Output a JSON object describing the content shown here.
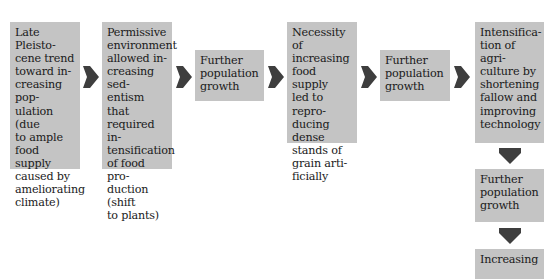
{
  "diagram": {
    "type": "flowchart",
    "colors": {
      "box_fill": "#c4c4c4",
      "arrow_fill": "#3e3e3e",
      "text": "#1a1a1a",
      "background": "#ffffff"
    },
    "nodes": [
      {
        "id": "n1",
        "text": "Late Pleisto-\ncene trend\ntoward in-\ncreasing pop-\nulation (due\nto ample\nfood supply\ncaused by\nameliorating\nclimate)"
      },
      {
        "id": "n2",
        "text": "Permissive\nenvironment\nallowed in-\ncreasing sed-\nentism that\nrequired in-\ntensification\nof food pro-\nduction (shift\nto plants)"
      },
      {
        "id": "n3",
        "text": "Further\npopulation\ngrowth"
      },
      {
        "id": "n4",
        "text": "Necessity of\nincreasing\nfood supply\nled to repro-\nducing dense\nstands of\ngrain arti-\nficially"
      },
      {
        "id": "n5",
        "text": "Further\npopulation\ngrowth"
      },
      {
        "id": "n6",
        "text": "Intensifica-\ntion of agri-\nculture by\nshortening\nfallow and\nimproving\ntechnology"
      },
      {
        "id": "n7",
        "text": "Further\npopulation\ngrowth"
      },
      {
        "id": "n8",
        "text": "Increasing"
      }
    ],
    "edges": [
      {
        "from": "n1",
        "to": "n2",
        "direction": "right"
      },
      {
        "from": "n2",
        "to": "n3",
        "direction": "right"
      },
      {
        "from": "n3",
        "to": "n4",
        "direction": "right"
      },
      {
        "from": "n4",
        "to": "n5",
        "direction": "right"
      },
      {
        "from": "n5",
        "to": "n6",
        "direction": "right"
      },
      {
        "from": "n6",
        "to": "n7",
        "direction": "down"
      },
      {
        "from": "n7",
        "to": "n8",
        "direction": "down"
      }
    ]
  }
}
